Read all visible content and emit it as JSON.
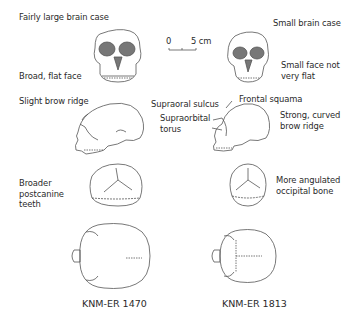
{
  "figure": {
    "scale_bar": {
      "start": "0",
      "end": "5 cm"
    },
    "left_specimen": {
      "caption": "KNM-ER 1470",
      "labels": {
        "brain_case": "Fairly large brain case",
        "face": "Broad, flat face",
        "brow": "Slight brow ridge",
        "teeth": "Broader\npostcanine\nteeth"
      }
    },
    "right_specimen": {
      "caption": "KNM-ER 1813",
      "labels": {
        "brain_case": "Small brain case",
        "face": "Small face not\nvery flat",
        "brow": "Strong, curved\nbrow ridge",
        "occipital": "More angulated\noccipital bone",
        "supraoral": "Supraoral sulcus",
        "frontal": "Frontal squama",
        "supraorbital": "Supraorbital\ntorus"
      }
    },
    "views": [
      "frontal",
      "lateral",
      "posterior",
      "superior"
    ],
    "colors": {
      "line": "#555555",
      "orbit_fill": "#777777",
      "text": "#2a2a2a",
      "background": "#ffffff"
    }
  }
}
